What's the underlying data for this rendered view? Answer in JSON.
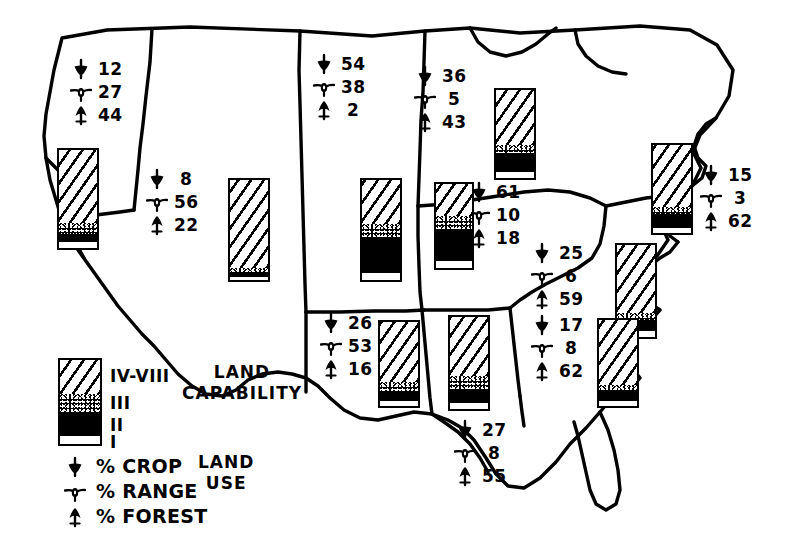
{
  "figure": {
    "captions": [
      {
        "name": "land-capability",
        "lines": [
          "LAND",
          "CAPABILITY"
        ],
        "x": 182,
        "y": 362
      },
      {
        "name": "land-use",
        "lines": [
          "LAND",
          "USE"
        ],
        "x": 198,
        "y": 452
      }
    ]
  },
  "legend": {
    "capability_classes": [
      {
        "label": "IV-VIII",
        "fill": "hatch"
      },
      {
        "label": "III",
        "fill": "stipple"
      },
      {
        "label": "II",
        "fill": "solid"
      },
      {
        "label": "I",
        "fill": "white"
      }
    ],
    "land_use_keys": [
      {
        "icon": "crop-arrow-down-icon",
        "label": "% CROP"
      },
      {
        "icon": "range-circle-icon",
        "label": "% RANGE"
      },
      {
        "icon": "forest-tree-icon",
        "label": "% FOREST"
      }
    ]
  },
  "chart_data": {
    "type": "map",
    "units": "percent",
    "land_use_categories": [
      "% CROP",
      "% RANGE",
      "% FOREST"
    ],
    "capability_classes": [
      "IV-VIII",
      "III",
      "II",
      "I"
    ],
    "regions": [
      {
        "name": "Pacific",
        "stats": {
          "crop": 12,
          "range": 27,
          "forest": 44
        },
        "stats_pos": {
          "x": 70,
          "y": 57
        },
        "bar": {
          "x": 57,
          "y": 148,
          "w": 42,
          "h": 102,
          "segments": [
            {
              "class": "IV-VIII",
              "fill": "hatch",
              "pct": 74
            },
            {
              "class": "III",
              "fill": "stipple",
              "pct": 12
            },
            {
              "class": "II",
              "fill": "solid",
              "pct": 8
            },
            {
              "class": "I",
              "fill": "white",
              "pct": 6
            }
          ]
        }
      },
      {
        "name": "Mountain",
        "stats": {
          "crop": 8,
          "range": 56,
          "forest": 22
        },
        "stats_pos": {
          "x": 146,
          "y": 167
        },
        "bar": {
          "x": 228,
          "y": 178,
          "w": 42,
          "h": 104,
          "segments": [
            {
              "class": "IV-VIII",
              "fill": "hatch",
              "pct": 88
            },
            {
              "class": "III",
              "fill": "stipple",
              "pct": 4
            },
            {
              "class": "II",
              "fill": "solid",
              "pct": 5
            },
            {
              "class": "I",
              "fill": "white",
              "pct": 3
            }
          ]
        }
      },
      {
        "name": "Northern Plains",
        "stats": {
          "crop": 54,
          "range": 38,
          "forest": 2
        },
        "stats_pos": {
          "x": 313,
          "y": 52
        },
        "bar": {
          "x": 360,
          "y": 178,
          "w": 42,
          "h": 104,
          "segments": [
            {
              "class": "IV-VIII",
              "fill": "hatch",
              "pct": 44
            },
            {
              "class": "III",
              "fill": "stipple",
              "pct": 13
            },
            {
              "class": "II",
              "fill": "solid",
              "pct": 36
            },
            {
              "class": "I",
              "fill": "white",
              "pct": 7
            }
          ]
        }
      },
      {
        "name": "Lake States",
        "stats": {
          "crop": 36,
          "range": 5,
          "forest": 43
        },
        "stats_pos": {
          "x": 414,
          "y": 64
        },
        "bar": {
          "x": 494,
          "y": 88,
          "w": 42,
          "h": 92,
          "segments": [
            {
              "class": "IV-VIII",
              "fill": "hatch",
              "pct": 62
            },
            {
              "class": "III",
              "fill": "stipple",
              "pct": 10
            },
            {
              "class": "II",
              "fill": "solid",
              "pct": 21
            },
            {
              "class": "I",
              "fill": "white",
              "pct": 7
            }
          ]
        }
      },
      {
        "name": "Corn Belt",
        "stats": {
          "crop": 61,
          "range": 10,
          "forest": 18
        },
        "stats_pos": {
          "x": 468,
          "y": 180
        },
        "bar": {
          "x": 434,
          "y": 182,
          "w": 40,
          "h": 88,
          "segments": [
            {
              "class": "IV-VIII",
              "fill": "hatch",
              "pct": 38
            },
            {
              "class": "III",
              "fill": "stipple",
              "pct": 15
            },
            {
              "class": "II",
              "fill": "solid",
              "pct": 39
            },
            {
              "class": "I",
              "fill": "white",
              "pct": 8
            }
          ]
        }
      },
      {
        "name": "Northeast",
        "stats": {
          "crop": 15,
          "range": 3,
          "forest": 62
        },
        "stats_pos": {
          "x": 700,
          "y": 163
        },
        "bar": {
          "x": 651,
          "y": 143,
          "w": 42,
          "h": 92,
          "segments": [
            {
              "class": "IV-VIII",
              "fill": "hatch",
              "pct": 70
            },
            {
              "class": "III",
              "fill": "stipple",
              "pct": 8
            },
            {
              "class": "II",
              "fill": "solid",
              "pct": 16
            },
            {
              "class": "I",
              "fill": "white",
              "pct": 6
            }
          ]
        }
      },
      {
        "name": "Appalachian",
        "stats": {
          "crop": 25,
          "range": 6,
          "forest": 59
        },
        "stats_pos": {
          "x": 531,
          "y": 241
        },
        "bar": {
          "x": 615,
          "y": 243,
          "w": 42,
          "h": 96,
          "segments": [
            {
              "class": "IV-VIII",
              "fill": "hatch",
              "pct": 74
            },
            {
              "class": "III",
              "fill": "stipple",
              "pct": 8
            },
            {
              "class": "II",
              "fill": "solid",
              "pct": 12
            },
            {
              "class": "I",
              "fill": "white",
              "pct": 6
            }
          ]
        }
      },
      {
        "name": "Southern Plains",
        "stats": {
          "crop": 26,
          "range": 53,
          "forest": 16
        },
        "stats_pos": {
          "x": 320,
          "y": 311
        },
        "bar": {
          "x": 378,
          "y": 320,
          "w": 42,
          "h": 88,
          "segments": [
            {
              "class": "IV-VIII",
              "fill": "hatch",
              "pct": 72
            },
            {
              "class": "III",
              "fill": "stipple",
              "pct": 10
            },
            {
              "class": "II",
              "fill": "solid",
              "pct": 12
            },
            {
              "class": "I",
              "fill": "white",
              "pct": 6
            }
          ]
        }
      },
      {
        "name": "Delta States",
        "stats": {
          "crop": 27,
          "range": 8,
          "forest": 55
        },
        "stats_pos": {
          "x": 454,
          "y": 418
        },
        "bar": {
          "x": 448,
          "y": 315,
          "w": 42,
          "h": 96,
          "segments": [
            {
              "class": "IV-VIII",
              "fill": "hatch",
              "pct": 64
            },
            {
              "class": "III",
              "fill": "stipple",
              "pct": 14
            },
            {
              "class": "II",
              "fill": "solid",
              "pct": 15
            },
            {
              "class": "I",
              "fill": "white",
              "pct": 7
            }
          ]
        }
      },
      {
        "name": "Southeast",
        "stats": {
          "crop": 17,
          "range": 8,
          "forest": 62
        },
        "stats_pos": {
          "x": 531,
          "y": 313
        },
        "bar": {
          "x": 597,
          "y": 318,
          "w": 42,
          "h": 90,
          "segments": [
            {
              "class": "IV-VIII",
              "fill": "hatch",
              "pct": 76
            },
            {
              "class": "III",
              "fill": "stipple",
              "pct": 7
            },
            {
              "class": "II",
              "fill": "solid",
              "pct": 11
            },
            {
              "class": "I",
              "fill": "white",
              "pct": 6
            }
          ]
        }
      }
    ]
  }
}
